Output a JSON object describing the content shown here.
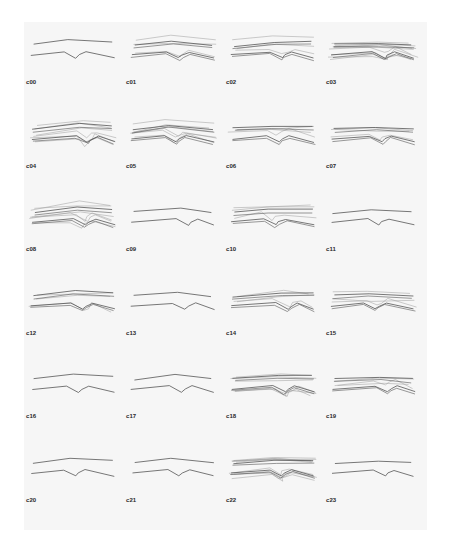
{
  "colors": {
    "background": "#f6f6f6",
    "stroke_dark": "#555555",
    "stroke_light": "#9a9a9a",
    "label": "#2a2a2a"
  },
  "cells": [
    {
      "label": "c00",
      "density": 1
    },
    {
      "label": "c01",
      "density": 2
    },
    {
      "label": "c02",
      "density": 2
    },
    {
      "label": "c03",
      "density": 4
    },
    {
      "label": "c04",
      "density": 3
    },
    {
      "label": "c05",
      "density": 3
    },
    {
      "label": "c06",
      "density": 2
    },
    {
      "label": "c07",
      "density": 2
    },
    {
      "label": "c08",
      "density": 3
    },
    {
      "label": "c09",
      "density": 1
    },
    {
      "label": "c10",
      "density": 2
    },
    {
      "label": "c11",
      "density": 1
    },
    {
      "label": "c12",
      "density": 2
    },
    {
      "label": "c13",
      "density": 1
    },
    {
      "label": "c14",
      "density": 2
    },
    {
      "label": "c15",
      "density": 2
    },
    {
      "label": "c16",
      "density": 1
    },
    {
      "label": "c17",
      "density": 1
    },
    {
      "label": "c18",
      "density": 3
    },
    {
      "label": "c19",
      "density": 2
    },
    {
      "label": "c20",
      "density": 1
    },
    {
      "label": "c21",
      "density": 1
    },
    {
      "label": "c22",
      "density": 4
    },
    {
      "label": "c23",
      "density": 1
    }
  ]
}
